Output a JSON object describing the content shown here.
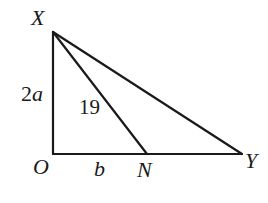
{
  "diagram": {
    "type": "right-triangle-geometry",
    "points": {
      "X": {
        "label": "X",
        "x": 53,
        "y": 32
      },
      "O": {
        "label": "O",
        "x": 53,
        "y": 154
      },
      "N": {
        "label": "N",
        "x": 147,
        "y": 154
      },
      "Y": {
        "label": "Y",
        "x": 242,
        "y": 154
      }
    },
    "segments": [
      {
        "from": "X",
        "to": "O",
        "name": "XO"
      },
      {
        "from": "O",
        "to": "Y",
        "name": "OY"
      },
      {
        "from": "X",
        "to": "Y",
        "name": "XY"
      },
      {
        "from": "X",
        "to": "N",
        "name": "XN"
      }
    ],
    "labels": {
      "X": "X",
      "O": "O",
      "N": "N",
      "Y": "Y",
      "xo_length": "2a",
      "on_length": "b",
      "xn_length": "19"
    },
    "colors": {
      "line": "#1a1a1a",
      "background": "#ffffff"
    }
  }
}
